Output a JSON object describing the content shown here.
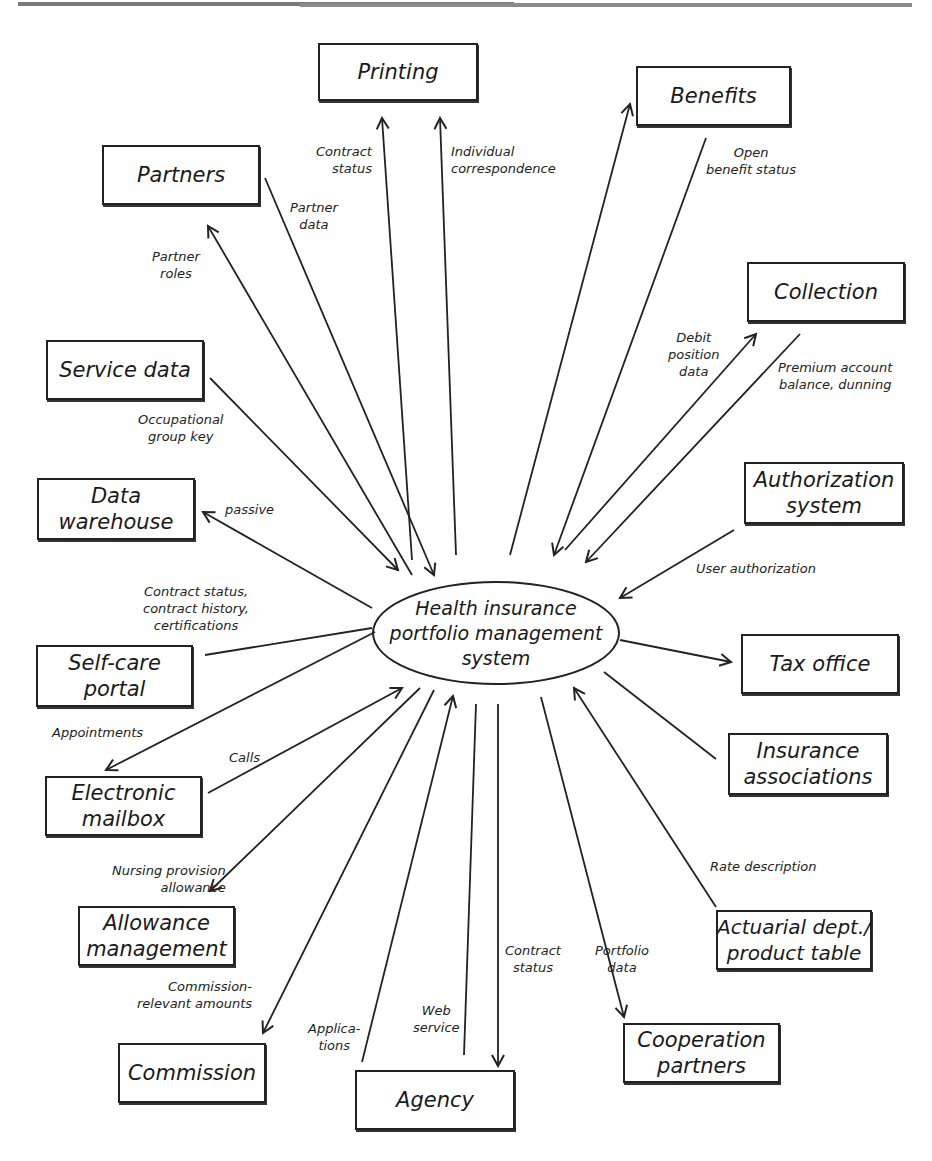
{
  "center": {
    "label": "Health insurance\nportfolio management\nsystem"
  },
  "systems": [
    {
      "id": "printing",
      "label": "Printing"
    },
    {
      "id": "benefits",
      "label": "Benefits"
    },
    {
      "id": "partners",
      "label": "Partners"
    },
    {
      "id": "collection",
      "label": "Collection"
    },
    {
      "id": "service-data",
      "label": "Service data"
    },
    {
      "id": "data-warehouse",
      "label": "Data\nwarehouse"
    },
    {
      "id": "authorization-system",
      "label": "Authorization\nsystem"
    },
    {
      "id": "self-care-portal",
      "label": "Self-care\nportal"
    },
    {
      "id": "tax-office",
      "label": "Tax office"
    },
    {
      "id": "insurance-associations",
      "label": "Insurance\nassociations"
    },
    {
      "id": "electronic-mailbox",
      "label": "Electronic\nmailbox"
    },
    {
      "id": "allowance-management",
      "label": "Allowance\nmanagement"
    },
    {
      "id": "actuarial-dept",
      "label": "Actuarial dept./\nproduct table"
    },
    {
      "id": "commission",
      "label": "Commission"
    },
    {
      "id": "cooperation-partners",
      "label": "Cooperation\npartners"
    },
    {
      "id": "agency",
      "label": "Agency"
    }
  ],
  "flows": [
    {
      "label": "Contract\nstatus",
      "target": "Printing",
      "direction": "out"
    },
    {
      "label": "Individual\ncorrespondence",
      "target": "Printing",
      "direction": "out"
    },
    {
      "label": "Open\nbenefit status",
      "target": "Benefits",
      "direction": "in"
    },
    {
      "label": "Partner\ndata",
      "target": "Partners",
      "direction": "in"
    },
    {
      "label": "Partner\nroles",
      "target": "Partners",
      "direction": "out"
    },
    {
      "label": "Debit\nposition\ndata",
      "target": "Collection",
      "direction": "out"
    },
    {
      "label": "Premium account\nbalance, dunning",
      "target": "Collection",
      "direction": "in"
    },
    {
      "label": "Occupational\ngroup key",
      "target": "Service data",
      "direction": "in"
    },
    {
      "label": "passive",
      "target": "Data warehouse",
      "direction": "out"
    },
    {
      "label": "User authorization",
      "target": "Authorization system",
      "direction": "in"
    },
    {
      "label": "Contract status,\ncontract history,\ncertifications",
      "target": "Self-care portal",
      "direction": "out"
    },
    {
      "label": "Appointments",
      "target": "Electronic mailbox",
      "direction": "out"
    },
    {
      "label": "Calls",
      "target": "Electronic mailbox",
      "direction": "in"
    },
    {
      "label": "Nursing provision\nallowance",
      "target": "Allowance management",
      "direction": "out"
    },
    {
      "label": "Rate description",
      "target": "Actuarial dept./product table",
      "direction": "in"
    },
    {
      "label": "Commission-\nrelevant amounts",
      "target": "Commission",
      "direction": "out"
    },
    {
      "label": "Applica-\ntions",
      "target": "Agency",
      "direction": "in"
    },
    {
      "label": "Web\nservice",
      "target": "Agency",
      "direction": "in"
    },
    {
      "label": "Contract\nstatus",
      "target": "Agency",
      "direction": "out"
    },
    {
      "label": "Portfolio\ndata",
      "target": "Cooperation partners",
      "direction": "out"
    }
  ]
}
